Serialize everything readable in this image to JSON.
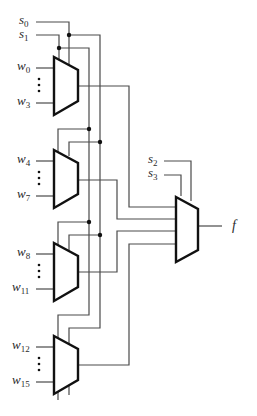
{
  "diagram": {
    "colors": {
      "wire": "#4a4a4a",
      "mux_outline": "#111111",
      "dot": "#111111",
      "text": "#2a2a2a"
    },
    "select_inputs": [
      {
        "name": "s",
        "sub": "0"
      },
      {
        "name": "s",
        "sub": "1"
      },
      {
        "name": "s",
        "sub": "2"
      },
      {
        "name": "s",
        "sub": "3"
      }
    ],
    "muxes": [
      {
        "id": "mux-1",
        "inputs": [
          {
            "name": "w",
            "sub": "0"
          },
          {
            "name": "w",
            "sub": "3"
          }
        ]
      },
      {
        "id": "mux-2",
        "inputs": [
          {
            "name": "w",
            "sub": "4"
          },
          {
            "name": "w",
            "sub": "7"
          }
        ]
      },
      {
        "id": "mux-3",
        "inputs": [
          {
            "name": "w",
            "sub": "8"
          },
          {
            "name": "w",
            "sub": "11"
          }
        ]
      },
      {
        "id": "mux-4",
        "inputs": [
          {
            "name": "w",
            "sub": "12"
          },
          {
            "name": "w",
            "sub": "15"
          }
        ]
      }
    ],
    "output": {
      "name": "f"
    }
  }
}
